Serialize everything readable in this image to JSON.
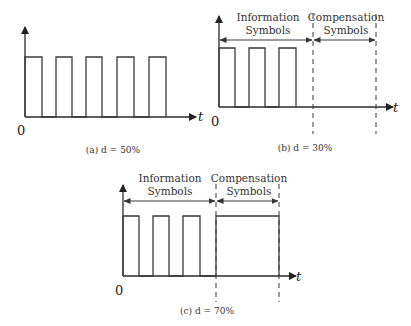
{
  "panels": [
    {
      "id": "a",
      "caption": "(a) d = 50%",
      "origin_label": "0",
      "axis_label": "t",
      "duty_cycle": "50%",
      "pulse_count": 5
    },
    {
      "id": "b",
      "caption": "(b) d = 30%",
      "origin_label": "0",
      "axis_label": "t",
      "duty_cycle": "30%",
      "pulse_count": 3,
      "regions": [
        {
          "line1": "Information",
          "line2": "Symbols"
        },
        {
          "line1": "Compensation",
          "line2": "Symbols"
        }
      ],
      "compensation_level": "low"
    },
    {
      "id": "c",
      "caption": "(c) d = 70%",
      "origin_label": "0",
      "axis_label": "t",
      "duty_cycle": "70%",
      "pulse_count": 3,
      "regions": [
        {
          "line1": "Information",
          "line2": "Symbols"
        },
        {
          "line1": "Compensation",
          "line2": "Symbols"
        }
      ],
      "compensation_level": "high"
    }
  ]
}
